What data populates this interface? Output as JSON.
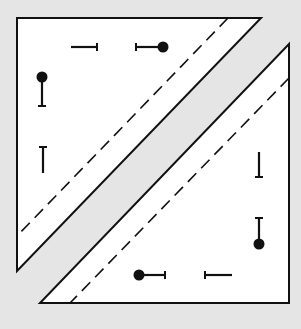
{
  "diagram": {
    "colors": {
      "background": "#e5e5e5",
      "fill": "#ffffff",
      "stroke": "#111111"
    },
    "upper_triangle": {
      "vertices": [
        [
          17,
          18
        ],
        [
          261,
          18
        ],
        [
          17,
          271
        ]
      ],
      "dashed_line": [
        [
          228,
          18
        ],
        [
          17,
          236
        ]
      ],
      "markers": [
        {
          "type": "bar-tick",
          "orientation": "horizontal",
          "line": [
            [
              71,
              47
            ],
            [
              97,
              47
            ]
          ],
          "tick_at": "end"
        },
        {
          "type": "pin",
          "orientation": "horizontal",
          "line": [
            [
              136,
              47
            ],
            [
              163,
              47
            ]
          ],
          "tick_at": "start",
          "dot_at": "end"
        },
        {
          "type": "pin",
          "orientation": "vertical",
          "line": [
            [
              42,
              77
            ],
            [
              42,
              106
            ]
          ],
          "tick_at": "end",
          "dot_at": "start"
        },
        {
          "type": "bar-tick",
          "orientation": "vertical",
          "line": [
            [
              43,
              147
            ],
            [
              43,
              173
            ]
          ],
          "tick_at": "start"
        }
      ]
    },
    "lower_triangle": {
      "vertices": [
        [
          289,
          44
        ],
        [
          289,
          303
        ],
        [
          40,
          303
        ]
      ],
      "dashed_line": [
        [
          289,
          78
        ],
        [
          70,
          303
        ]
      ],
      "markers": [
        {
          "type": "bar-tick",
          "orientation": "vertical",
          "line": [
            [
              259,
              152
            ],
            [
              259,
              177
            ]
          ],
          "tick_at": "end"
        },
        {
          "type": "pin",
          "orientation": "vertical",
          "line": [
            [
              259,
              218
            ],
            [
              259,
              244
            ]
          ],
          "tick_at": "start",
          "dot_at": "end"
        },
        {
          "type": "pin",
          "orientation": "horizontal",
          "line": [
            [
              139,
              275
            ],
            [
              165,
              275
            ]
          ],
          "tick_at": "end",
          "dot_at": "start"
        },
        {
          "type": "bar-tick",
          "orientation": "horizontal",
          "line": [
            [
              205,
              275
            ],
            [
              232,
              275
            ]
          ],
          "tick_at": "start"
        }
      ]
    }
  }
}
